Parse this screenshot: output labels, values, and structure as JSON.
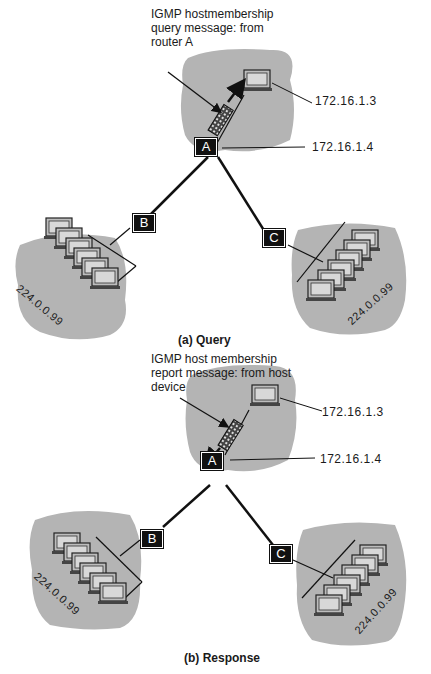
{
  "panels": [
    {
      "caption": "(a) Query",
      "annotation_lines": [
        "IGMP hostmembership",
        "query message: from",
        "router A"
      ],
      "host_ip": "172.16.1.3",
      "router_ip": "172.16.1.4",
      "routers": {
        "a": "A",
        "b": "B",
        "c": "C"
      },
      "group_b": "224.0.0.99",
      "group_c": "224.0.0.99",
      "arrow_direction": "up"
    },
    {
      "caption": "(b) Response",
      "annotation_lines": [
        "IGMP host membership",
        "report message: from host",
        "device"
      ],
      "host_ip": "172.16.1.3",
      "router_ip": "172.16.1.4",
      "routers": {
        "a": "A",
        "b": "B",
        "c": "C"
      },
      "group_b": "224.0.0.99",
      "group_c": "224.0.0.99",
      "arrow_direction": "down"
    }
  ],
  "colors": {
    "cloud": "#b4b4b4",
    "router": "#111111",
    "line": "#111111"
  }
}
